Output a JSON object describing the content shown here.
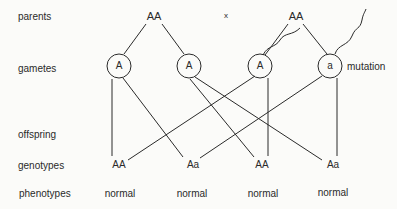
{
  "row_labels": {
    "parents": "parents",
    "gametes": "gametes",
    "offspring": "offspring",
    "genotypes": "genotypes",
    "phenotypes": "phenotypes"
  },
  "parents": {
    "left": "AA",
    "cross": "x",
    "right": "AA"
  },
  "gametes": [
    "A",
    "A",
    "A",
    "a"
  ],
  "mutation_label": "mutation",
  "genotypes": [
    "AA",
    "Aa",
    "AA",
    "Aa"
  ],
  "phenotypes": [
    "normal",
    "normal",
    "normal",
    "normal"
  ],
  "colors": {
    "line": "#2a2a2a",
    "background": "#fbfbf9"
  }
}
